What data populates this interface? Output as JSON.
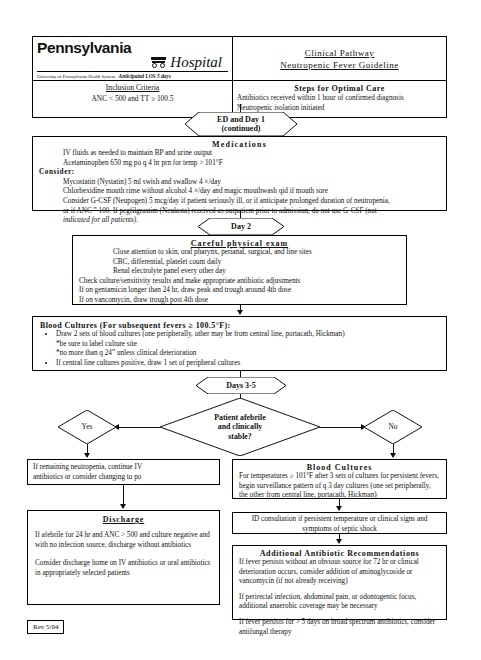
{
  "header": {
    "logo": {
      "line1": "Pennsylvania",
      "line2": "Hospital",
      "subline": "University of Pennsylvania Health System",
      "los": "Anticipated LOS 5 days"
    },
    "title_line1": "Clinical Pathway",
    "title_line2": "Neutropenic Fever Guideline",
    "inclusion_heading": "Inclusion Criteria",
    "inclusion_body": "ANC < 500 and TT ≥ 100.5",
    "steps_heading": "Steps for Optimal Care",
    "steps_line1": "Antibiotics received within 1 hour of confirmed diagnosis",
    "steps_line2": "Neutropenic isolation initiated"
  },
  "phase1": {
    "label_line1": "ED and Day 1",
    "label_line2": "(continued)"
  },
  "medications": {
    "title": "Medications",
    "line1": "IV fluids as needed to maintain BP and urine output",
    "line2": "Acetaminophen 650 mg po q 4 hr prn for temp > 101°F",
    "consider_label": "Consider:",
    "c1": "Mycostatin (Nystatin) 5 ml swish and swallow 4 ×/day",
    "c2": "Chlorhexidine mouth rinse without alcohol 4 ×/day and magic mouthwash qid if mouth sore",
    "c3": "Consider G-CSF (Neupogen) 5 mcg/day if patient seriously ill, or if anticipate prolonged duration of neutropenia,",
    "c4": "or if ANC ˮ 100. If pegfilgrastim (Neulasta) received as outpatient prior to admission, do not use G-CSF (not",
    "c5": "indicated for all patients)."
  },
  "phase2": {
    "label": "Day 2"
  },
  "exam": {
    "title": "Careful physical exam",
    "i1": "Close attention to skin, oral pharynx, perianal, surgical, and line sites",
    "i2": "CBC, differential, platelet count daily",
    "i3": "Renal electrolyte panel every other day",
    "l1": "Check culture/sensitivity results and make appropriate antibiotic adjustments",
    "l2": "If on gentamicin longer than 24 hr, draw peak and trough around 4th dose",
    "l3": "If on vancomycin, draw trough post 4th dose"
  },
  "blood_cultures_1": {
    "title": "Blood Cultures (For subsequent fevers ≥ 100.5°F):",
    "b1": "Draw 2 sets of blood cultures (one peripherally, other may be from central line, portacath, Hickman)",
    "b1s1": "*be sure to label culture site",
    "b1s2": "*no more than q 24ˮ unless clinical deterioration",
    "b2": "If central line cultures positive, draw 1 set of peripheral cultures"
  },
  "phase3": {
    "label": "Days 3-5"
  },
  "decision": {
    "line1": "Patient afebrile",
    "line2": "and clinically",
    "line3": "stable?",
    "yes": "Yes",
    "no": "No"
  },
  "continue_box": {
    "line1": "If remaining neutropenia, continue IV",
    "line2": "antibiotics or consider changing to po"
  },
  "discharge": {
    "title": "Discharge",
    "p1": "If afebrile for 24 hr and ANC > 500 and culture negative and with no infection source, discharge without antibiotics",
    "p2": "Consider discharge home on IV antibiotics or oral antibiotics in appropriately selected patients"
  },
  "blood_cultures_2": {
    "title": "Blood Cultures",
    "body": "For temperatures ≥ 101°F after 3 sets of cultures for persistent fevers, begin surveillance pattern of q 3 day cultures (one set peripherally, the other from central line, portacath, Hickman)"
  },
  "id_consult": {
    "body": "ID consultation if persistent temperature or clinical signs and symptoms of septic shock"
  },
  "additional": {
    "title": "Additional Antibiotic Recommendations",
    "p1": "If fever persists without an obvious source for 72 hr or clinical deterioration occurs, consider addition of aminoglycoside or vancomycin (if not already receiving)",
    "p2": "If perirectal infection, abdominal pain, or odontogentic focus, additional anaerobic coverage may be necessary",
    "p3": "If fever persists for > 5 days on broad spectrum antibiotics, consider antifungal therapy"
  },
  "revision": {
    "label": "Rev 5/04"
  }
}
